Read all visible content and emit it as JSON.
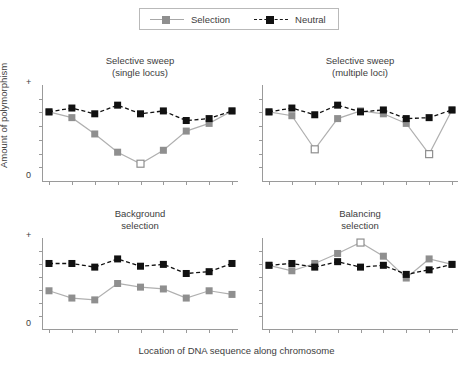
{
  "legend": {
    "entries": [
      {
        "label": "Selection",
        "color": "#8f8f8f",
        "style": "solid"
      },
      {
        "label": "Neutral",
        "color": "#111111",
        "style": "dashed"
      }
    ]
  },
  "axes": {
    "ylabel": "Amount of polymorphism",
    "xlabel": "Location of DNA sequence along chromosome",
    "ytop": "+",
    "ybottom": "0"
  },
  "chart_data": [
    {
      "type": "line",
      "title": "Selective sweep\n(single locus)",
      "title_line1": "Selective sweep",
      "title_line2": "(single locus)",
      "panel": "top-left",
      "xlabel": "Location of DNA sequence along chromosome",
      "ylabel": "Amount of polymorphism",
      "ylim": [
        0,
        1
      ],
      "x": [
        1,
        2,
        3,
        4,
        5,
        6,
        7,
        8,
        9
      ],
      "grid": false,
      "series": [
        {
          "name": "Selection",
          "values": [
            0.72,
            0.66,
            0.49,
            0.3,
            0.18,
            0.32,
            0.52,
            0.6,
            0.73
          ],
          "open_marker_index": 4
        },
        {
          "name": "Neutral",
          "values": [
            0.72,
            0.76,
            0.7,
            0.79,
            0.7,
            0.73,
            0.63,
            0.65,
            0.73
          ]
        }
      ]
    },
    {
      "type": "line",
      "title": "Selective sweep\n(multiple loci)",
      "title_line1": "Selective sweep",
      "title_line2": "(multiple loci)",
      "panel": "top-right",
      "xlabel": "Location of DNA sequence along chromosome",
      "ylabel": "Amount of polymorphism",
      "ylim": [
        0,
        1
      ],
      "x": [
        1,
        2,
        3,
        4,
        5,
        6,
        7,
        8,
        9
      ],
      "grid": false,
      "series": [
        {
          "name": "Selection",
          "values": [
            0.72,
            0.68,
            0.33,
            0.65,
            0.73,
            0.7,
            0.6,
            0.28,
            0.74
          ],
          "open_marker_index": [
            2,
            7
          ]
        },
        {
          "name": "Neutral",
          "values": [
            0.72,
            0.76,
            0.69,
            0.79,
            0.72,
            0.74,
            0.65,
            0.66,
            0.74
          ]
        }
      ]
    },
    {
      "type": "line",
      "title": "Background\nselection",
      "title_line1": "Background",
      "title_line2": "selection",
      "panel": "bottom-left",
      "xlabel": "Location of DNA sequence along chromosome",
      "ylabel": "Amount of polymorphism",
      "ylim": [
        0,
        1
      ],
      "x": [
        1,
        2,
        3,
        4,
        5,
        6,
        7,
        8,
        9
      ],
      "grid": false,
      "series": [
        {
          "name": "Selection",
          "values": [
            0.42,
            0.34,
            0.32,
            0.5,
            0.46,
            0.44,
            0.34,
            0.42,
            0.38
          ]
        },
        {
          "name": "Neutral",
          "values": [
            0.72,
            0.72,
            0.68,
            0.77,
            0.69,
            0.71,
            0.61,
            0.63,
            0.72
          ]
        }
      ]
    },
    {
      "type": "line",
      "title": "Balancing\nselection",
      "title_line1": "Balancing",
      "title_line2": "selection",
      "panel": "bottom-right",
      "xlabel": "Location of DNA sequence along chromosome",
      "ylabel": "Amount of polymorphism",
      "ylim": [
        0,
        1
      ],
      "x": [
        1,
        2,
        3,
        4,
        5,
        6,
        7,
        8,
        9
      ],
      "grid": false,
      "series": [
        {
          "name": "Selection",
          "values": [
            0.7,
            0.64,
            0.72,
            0.83,
            0.95,
            0.8,
            0.56,
            0.77,
            0.71
          ],
          "open_marker_index": 4
        },
        {
          "name": "Neutral",
          "values": [
            0.7,
            0.72,
            0.68,
            0.74,
            0.68,
            0.7,
            0.6,
            0.65,
            0.71
          ]
        }
      ]
    }
  ]
}
